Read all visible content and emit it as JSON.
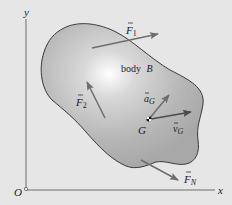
{
  "colors": {
    "background": "#e6e6e6",
    "body_fill": "#b4b4b4",
    "body_highlight": "#ffffff",
    "body_outline": "#3a3a3a",
    "arrow": "#6e6e6e",
    "axis": "#6e6e6e",
    "text": "#1a1a1a"
  },
  "axes": {
    "x_label": "x",
    "y_label": "y",
    "origin_label": "O"
  },
  "body": {
    "label": "body",
    "name": "B"
  },
  "vectors": {
    "F1": {
      "symbol": "F",
      "subscript": "1"
    },
    "F2": {
      "symbol": "F",
      "subscript": "2"
    },
    "FN": {
      "symbol": "F",
      "subscript": "N"
    },
    "aG": {
      "symbol": "a",
      "subscript": "G"
    },
    "vG": {
      "symbol": "v",
      "subscript": "G"
    }
  },
  "points": {
    "G": {
      "label": "G"
    }
  }
}
